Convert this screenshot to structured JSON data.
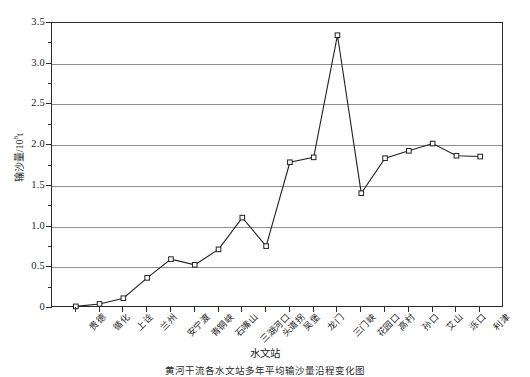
{
  "chart_data": {
    "type": "line",
    "title": "",
    "xlabel": "水文站",
    "ylabel": "输沙量/10⁸t",
    "ylabel_base": "输沙量/10",
    "ylabel_exp": "8",
    "ylabel_unit": "t",
    "ylim": [
      0,
      3.5
    ],
    "ytick_labels": [
      "0",
      "0.5",
      "1.0",
      "1.5",
      "2.0",
      "2.5",
      "3.0",
      "3.5"
    ],
    "ytick_values": [
      0,
      0.5,
      1.0,
      1.5,
      2.0,
      2.5,
      3.0,
      3.5
    ],
    "yminor_values": [
      0.25,
      0.75,
      1.25,
      1.75,
      2.25,
      2.75,
      3.25
    ],
    "grid": "horizontal",
    "legend": "none",
    "categories": [
      "贵德",
      "循化",
      "上诠",
      "兰州",
      "安宁渡",
      "青铜峡",
      "石嘴山",
      "三湖河口",
      "头道拐",
      "吴堡",
      "龙门",
      "三门峡",
      "花园口",
      "高村",
      "孙口",
      "艾山",
      "泺口",
      "利津"
    ],
    "values": [
      0.02,
      0.05,
      0.12,
      0.37,
      0.6,
      0.53,
      0.72,
      1.11,
      0.76,
      1.79,
      1.85,
      3.35,
      1.41,
      1.84,
      1.93,
      2.02,
      1.87,
      1.86
    ],
    "series": [
      {
        "name": "输沙量",
        "marker": "square",
        "values": [
          0.02,
          0.05,
          0.12,
          0.37,
          0.6,
          0.53,
          0.72,
          1.11,
          0.76,
          1.79,
          1.85,
          3.35,
          1.41,
          1.84,
          1.93,
          2.02,
          1.87,
          1.86
        ]
      }
    ]
  },
  "caption": "黄河干流各水文站多年平均输沙量沿程变化图",
  "colors": {
    "line": "#202020",
    "grid": "#8f8f8f",
    "frame": "#2b2b2b",
    "marker_fill": "#ffffff",
    "text": "#1c1c1c"
  }
}
